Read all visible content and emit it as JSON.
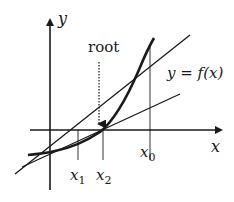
{
  "diagram": {
    "axes": {
      "x_label": "x",
      "y_label": "y"
    },
    "curve_label": "y = f(x)",
    "root_label": "root",
    "points": [
      {
        "name": "x0",
        "label": "x",
        "sub": "0"
      },
      {
        "name": "x1",
        "label": "x",
        "sub": "1"
      },
      {
        "name": "x2",
        "label": "x",
        "sub": "2"
      }
    ],
    "colors": {
      "ink": "#1a1a1a",
      "background": "#ffffff"
    }
  }
}
